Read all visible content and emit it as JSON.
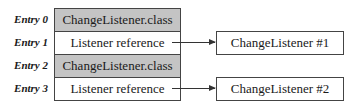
{
  "entries": [
    {
      "label": "Entry 0",
      "text": "ChangeListener.class",
      "shaded": true
    },
    {
      "label": "Entry 1",
      "text": "Listener reference",
      "shaded": false
    },
    {
      "label": "Entry 2",
      "text": "ChangeListener.class",
      "shaded": true
    },
    {
      "label": "Entry 3",
      "text": "Listener reference",
      "shaded": false
    }
  ],
  "targets": [
    {
      "text": "ChangeListener #1",
      "from_entry": 1
    },
    {
      "text": "ChangeListener #2",
      "from_entry": 3
    }
  ],
  "colors": {
    "shaded_cell": "#c4c4c4",
    "border": "#444444",
    "background": "#ffffff"
  }
}
